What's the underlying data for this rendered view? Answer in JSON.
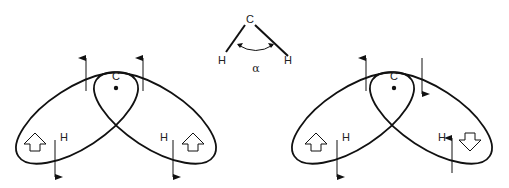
{
  "diagram": {
    "type": "orbital-spin-diagram",
    "colors": {
      "stroke": "#111111",
      "text": "#222222",
      "background": "#ffffff"
    },
    "bond_angle": {
      "center_atom": "C",
      "left_atom": "H",
      "right_atom": "H",
      "angle_label": "α"
    },
    "left_structure": {
      "center_label": "C",
      "left_lobe": {
        "atom_label": "H",
        "hollow_arrow": "up",
        "thin_arrows": [
          "up",
          "down"
        ]
      },
      "right_lobe": {
        "atom_label": "H",
        "hollow_arrow": "up",
        "thin_arrows": [
          "up",
          "down"
        ]
      }
    },
    "right_structure": {
      "center_label": "C",
      "left_lobe": {
        "atom_label": "H",
        "hollow_arrow": "up",
        "thin_arrows": [
          "up",
          "down"
        ]
      },
      "right_lobe": {
        "atom_label": "H",
        "hollow_arrow": "down",
        "thin_arrows": [
          "down",
          "up"
        ]
      }
    }
  }
}
